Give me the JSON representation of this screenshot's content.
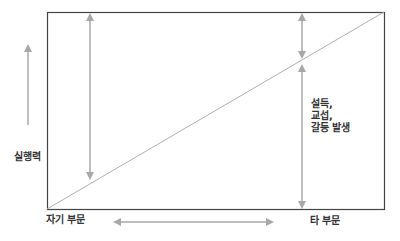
{
  "diagram": {
    "y_axis_label": "실행력",
    "x_left_label": "자기 부문",
    "x_right_label": "타 부문",
    "annotation_lines": [
      "설득,",
      "교섭,",
      "갈등 발생"
    ],
    "colors": {
      "frame": "#444444",
      "arrow": "#a8a8a8",
      "diagonal": "#b0b0b0",
      "text": "#333333"
    }
  }
}
